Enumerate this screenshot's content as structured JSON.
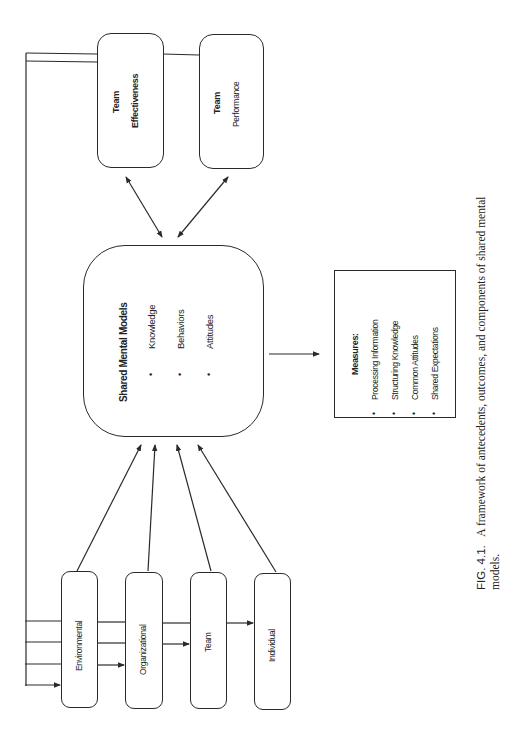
{
  "figure": {
    "orientation": "rotated-90-counterclockwise",
    "caption": {
      "label": "FIG. 4.1.",
      "text_line1": "A framework of antecedents, outcomes, and components of shared mental",
      "text_line2": "models."
    },
    "antecedents": [
      {
        "label": "Environmental"
      },
      {
        "label": "Organizational"
      },
      {
        "label": "Team"
      },
      {
        "label": "Individual"
      }
    ],
    "central": {
      "title": "Shared Mental Models",
      "components": [
        "Knowledge",
        "Behaviors",
        "Attitudes"
      ],
      "bullet": "•"
    },
    "outcomes": [
      {
        "line1": "Team",
        "line2": "Effectiveness"
      },
      {
        "line1": "Team",
        "line2": "Performance"
      }
    ],
    "measures": {
      "title": "Measures:",
      "items": [
        "Processing Information",
        "Structuring Knowledge",
        "Common Attitudes",
        "Shared Expectations"
      ],
      "bullet": "•"
    },
    "colors": {
      "line": "#2a2a2a",
      "background": "#ffffff",
      "text": "#222222"
    }
  }
}
